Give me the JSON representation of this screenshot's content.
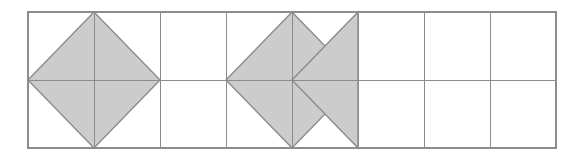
{
  "figure": {
    "title": "",
    "caption": "",
    "background_color": "#ffffff",
    "canvas": {
      "width": 583,
      "height": 160
    }
  },
  "grid": {
    "name": "rectangular-grid",
    "origin_x": 28,
    "origin_y": 12,
    "columns": 8,
    "rows": 2,
    "cell_width": 66,
    "cell_height": 68,
    "total_width": 528,
    "total_height": 136,
    "line_color": "#8c8c8c",
    "outer_line_color": "#8c8c8c",
    "line_width": 1,
    "outer_line_width": 1.2,
    "x_lines": [
      28,
      94,
      160,
      226,
      292,
      358,
      424,
      490,
      556
    ],
    "y_lines": [
      12,
      80,
      148
    ]
  },
  "shapes": {
    "fill_color": "#cccccc",
    "stroke_color": "#8c8c8c",
    "stroke_width": 1.4,
    "items": [
      {
        "name": "diamond-1",
        "kind": "rhombus",
        "points": "28,80 94,12 160,80 94,148",
        "center_cell": "column 1-2, rows 1-2",
        "shaded": true
      },
      {
        "name": "diamond-2",
        "kind": "rhombus",
        "points": "226,80 292,12 358,80 292,148",
        "center_cell": "column 4-5, rows 1-2",
        "shaded": true
      },
      {
        "name": "triangle-3",
        "kind": "triangle",
        "points": "292,80 358,12 358,148",
        "center_cell": "column 5, rows 1-2",
        "shaded": true
      }
    ]
  },
  "labels": {
    "axis_x": "",
    "axis_y": "",
    "annotations": []
  }
}
